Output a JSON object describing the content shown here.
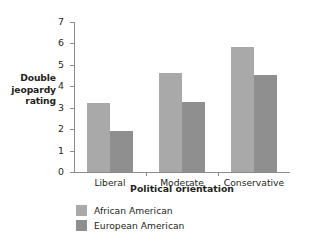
{
  "chart_data": {
    "type": "bar",
    "title": "",
    "subtitle": "",
    "xlabel": "Political orientation",
    "ylabel": "Double jeopardy rating",
    "ylabel_lines": [
      "Double",
      "jeopardy",
      "rating"
    ],
    "categories": [
      "Liberal",
      "Moderate",
      "Conservative"
    ],
    "series": [
      {
        "name": "African American",
        "color": "#a9a9a9",
        "values": [
          3.2,
          4.6,
          5.85
        ]
      },
      {
        "name": "European American",
        "color": "#8f8f8f",
        "values": [
          1.9,
          3.25,
          4.55
        ]
      }
    ],
    "ylim": [
      0,
      7
    ],
    "ytick_values": [
      0,
      1,
      2,
      3,
      4,
      5,
      6,
      7
    ],
    "ytick_labels": [
      "0",
      "1",
      "2",
      "3",
      "4",
      "5",
      "6",
      "7"
    ],
    "grid": false,
    "legend_position": "below",
    "orientation": "vertical"
  }
}
